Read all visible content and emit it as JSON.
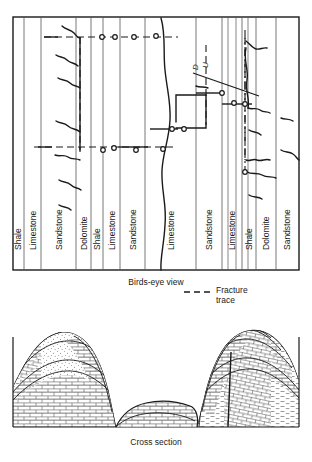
{
  "figure": {
    "type": "geologic-map-and-cross-section",
    "panels": [
      {
        "id": "birds-eye",
        "caption": "Birds-eye view"
      },
      {
        "id": "cross-section",
        "caption": "Cross section"
      }
    ]
  },
  "birds_eye": {
    "caption": "Birds-eye view",
    "units": [
      {
        "index": 0,
        "label": "Shale",
        "x0": 13,
        "x1": 24,
        "pattern": "shale"
      },
      {
        "index": 1,
        "label": "Limestone",
        "x0": 24,
        "x1": 41,
        "pattern": "limestone"
      },
      {
        "index": 2,
        "label": "Sandstone",
        "x0": 41,
        "x1": 76,
        "pattern": "sandstone"
      },
      {
        "index": 3,
        "label": "Dolomite",
        "x0": 76,
        "x1": 91,
        "pattern": "dolomite"
      },
      {
        "index": 4,
        "label": "Shale",
        "x0": 91,
        "x1": 103,
        "pattern": "shale"
      },
      {
        "index": 5,
        "label": "Limestone",
        "x0": 103,
        "x1": 120,
        "pattern": "limestone"
      },
      {
        "index": 6,
        "label": "Sandstone",
        "x0": 120,
        "x1": 145,
        "pattern": "sandstone"
      },
      {
        "index": 7,
        "label": "Limestone",
        "x0": 145,
        "x1": 196,
        "pattern": "limestone"
      },
      {
        "index": 8,
        "label": "Sandstone",
        "x0": 196,
        "x1": 222,
        "pattern": "sandstone"
      },
      {
        "index": 9,
        "label": "Limestone",
        "x0": 222,
        "x1": 242,
        "pattern": "limestone"
      },
      {
        "index": 10,
        "label": "Shale",
        "x0": 242,
        "x1": 256,
        "pattern": "shale"
      },
      {
        "index": 11,
        "label": "Dolomite",
        "x0": 256,
        "x1": 276,
        "pattern": "dolomite"
      },
      {
        "index": 12,
        "label": "Sandstone",
        "x0": 276,
        "x1": 299,
        "pattern": "sandstone"
      }
    ],
    "fault_annotation": {
      "down_label": "D",
      "up_label": "U",
      "orientation": "rotated-90"
    },
    "sinkhole_count": 11
  },
  "legend": {
    "fracture_trace_label_line1": "Fracture",
    "fracture_trace_label_line2": "trace",
    "symbol": "dashed-line"
  },
  "cross_section": {
    "caption": "Cross section",
    "landform": "karst valley between two hills"
  },
  "colors": {
    "ink": "#1a1a1a",
    "thin_line": "#555555",
    "background": "#ffffff"
  }
}
